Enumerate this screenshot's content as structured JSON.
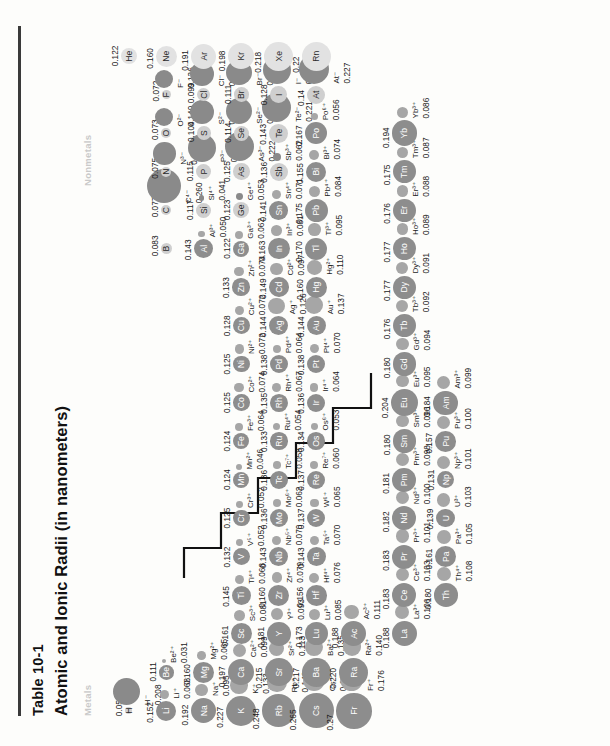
{
  "header": {
    "table_number": "Table 10-1",
    "title": "Atomic and Ionic Radii (in nanometers)",
    "legend_metals": "Metals",
    "legend_nonmetals": "Nonmetals"
  },
  "colors": {
    "metal_atom": "#8d8d8d",
    "nonmetal_atom": "#cfcfcf",
    "noble_atom": "#e2e2e2",
    "ion": "#a6a6a6",
    "rule": "#3a3a3a",
    "legend_text": "#c9c9c9"
  },
  "chart_data": {
    "type": "scatter",
    "title": "Atomic and Ionic Radii (in nanometers)",
    "xlabel": "Periodic group",
    "ylabel": "Period",
    "legend": [
      "Metals",
      "Nonmetals"
    ],
    "units": "nanometers",
    "note": "Circle area is proportional to radius; each element shows the neutral atom radius (large circle) and, where applicable, a common ion radius (small circle).",
    "elements": [
      {
        "symbol": "H",
        "atom": "0.053",
        "ion_symbol": "H⁻",
        "ion": "0.208",
        "class": "nonmetal",
        "group": 1,
        "period": 1
      },
      {
        "symbol": "He",
        "atom": "0.122",
        "ion_symbol": "",
        "ion": "",
        "class": "noble",
        "group": 18,
        "period": 1
      },
      {
        "symbol": "Li",
        "atom": "0.152",
        "ion_symbol": "Li⁺",
        "ion": "0.068",
        "class": "metal",
        "group": 1,
        "period": 2
      },
      {
        "symbol": "Be",
        "atom": "0.111",
        "ion_symbol": "Be²⁺",
        "ion": "0.031",
        "class": "metal",
        "group": 2,
        "period": 2
      },
      {
        "symbol": "B",
        "atom": "0.083",
        "ion_symbol": "",
        "ion": "",
        "class": "nonmetal",
        "group": 13,
        "period": 2
      },
      {
        "symbol": "C",
        "atom": "0.077",
        "ion_symbol": "C⁴⁻",
        "ion": "0.260",
        "class": "nonmetal",
        "group": 14,
        "period": 2
      },
      {
        "symbol": "N",
        "atom": "0.075",
        "ion_symbol": "N³⁻",
        "ion": "0.171",
        "class": "nonmetal",
        "group": 15,
        "period": 2
      },
      {
        "symbol": "O",
        "atom": "0.073",
        "ion_symbol": "O²⁻",
        "ion": "0.140",
        "class": "nonmetal",
        "group": 16,
        "period": 2
      },
      {
        "symbol": "F",
        "atom": "0.072",
        "ion_symbol": "F⁻",
        "ion": "0.136",
        "class": "nonmetal",
        "group": 17,
        "period": 2
      },
      {
        "symbol": "Ne",
        "atom": "0.160",
        "ion_symbol": "",
        "ion": "",
        "class": "noble",
        "group": 18,
        "period": 2
      },
      {
        "symbol": "Na",
        "atom": "0.192",
        "ion_symbol": "Na⁺",
        "ion": "0.095",
        "class": "metal",
        "group": 1,
        "period": 3
      },
      {
        "symbol": "Mg",
        "atom": "0.160",
        "ion_symbol": "Mg²⁺",
        "ion": "0.065",
        "class": "metal",
        "group": 2,
        "period": 3
      },
      {
        "symbol": "Al",
        "atom": "0.143",
        "ion_symbol": "Al³⁺",
        "ion": "0.050",
        "class": "metal",
        "group": 13,
        "period": 3
      },
      {
        "symbol": "Si",
        "atom": "0.117",
        "ion_symbol": "Si⁴⁺",
        "ion": "0.041",
        "class": "nonmetal",
        "group": 14,
        "period": 3
      },
      {
        "symbol": "P",
        "atom": "0.115",
        "ion_symbol": "P³⁻",
        "ion": "0.212",
        "class": "nonmetal",
        "group": 15,
        "period": 3
      },
      {
        "symbol": "S",
        "atom": "0.104",
        "ion_symbol": "S²⁻",
        "ion": "0.184",
        "class": "nonmetal",
        "group": 16,
        "period": 3
      },
      {
        "symbol": "Cl",
        "atom": "0.099",
        "ion_symbol": "Cl⁻",
        "ion": "0.181",
        "class": "nonmetal",
        "group": 17,
        "period": 3
      },
      {
        "symbol": "Ar",
        "atom": "0.191",
        "ion_symbol": "",
        "ion": "",
        "class": "noble",
        "group": 18,
        "period": 3
      },
      {
        "symbol": "K",
        "atom": "0.227",
        "ion_symbol": "K⁺",
        "ion": "0.133",
        "class": "metal",
        "group": 1,
        "period": 4
      },
      {
        "symbol": "Ca",
        "atom": "0.197",
        "ion_symbol": "Ca²⁺",
        "ion": "0.099",
        "class": "metal",
        "group": 2,
        "period": 4
      },
      {
        "symbol": "Sc",
        "atom": "0.161",
        "ion_symbol": "Sc³⁺",
        "ion": "0.081",
        "class": "metal",
        "group": 3,
        "period": 4
      },
      {
        "symbol": "Ti",
        "atom": "0.145",
        "ion_symbol": "Ti⁴⁺",
        "ion": "0.068",
        "class": "metal",
        "group": 4,
        "period": 4
      },
      {
        "symbol": "V",
        "atom": "0.132",
        "ion_symbol": "V⁵⁺",
        "ion": "0.052",
        "class": "metal",
        "group": 5,
        "period": 4
      },
      {
        "symbol": "Cr",
        "atom": "0.125",
        "ion_symbol": "Cr³⁺",
        "ion": "0.052",
        "class": "metal",
        "group": 6,
        "period": 4
      },
      {
        "symbol": "Mn",
        "atom": "0.124",
        "ion_symbol": "Mn²⁺",
        "ion": "0.046",
        "class": "metal",
        "group": 7,
        "period": 4
      },
      {
        "symbol": "Fe",
        "atom": "0.124",
        "ion_symbol": "Fe³⁺",
        "ion": "0.064",
        "class": "metal",
        "group": 8,
        "period": 4
      },
      {
        "symbol": "Co",
        "atom": "0.125",
        "ion_symbol": "Co²⁺",
        "ion": "0.074",
        "class": "metal",
        "group": 9,
        "period": 4
      },
      {
        "symbol": "Ni",
        "atom": "0.125",
        "ion_symbol": "Ni²⁺",
        "ion": "0.072",
        "class": "metal",
        "group": 10,
        "period": 4
      },
      {
        "symbol": "Cu",
        "atom": "0.128",
        "ion_symbol": "Cu²⁺",
        "ion": "0.072",
        "class": "metal",
        "group": 11,
        "period": 4
      },
      {
        "symbol": "Zn",
        "atom": "0.133",
        "ion_symbol": "Zn²⁺",
        "ion": "0.074",
        "class": "metal",
        "group": 12,
        "period": 4
      },
      {
        "symbol": "Ga",
        "atom": "0.122",
        "ion_symbol": "Ga³⁺",
        "ion": "0.062",
        "class": "metal",
        "group": 13,
        "period": 4
      },
      {
        "symbol": "Ge",
        "atom": "0.123",
        "ion_symbol": "Ge⁴⁺",
        "ion": "0.053",
        "class": "nonmetal",
        "group": 14,
        "period": 4
      },
      {
        "symbol": "As",
        "atom": "0.125",
        "ion_symbol": "As³⁻",
        "ion": "0.222",
        "class": "nonmetal",
        "group": 15,
        "period": 4
      },
      {
        "symbol": "Se",
        "atom": "0.114",
        "ion_symbol": "Se²⁻",
        "ion": "0.198",
        "class": "nonmetal",
        "group": 16,
        "period": 4
      },
      {
        "symbol": "Br",
        "atom": "0.111",
        "ion_symbol": "Br⁻",
        "ion": "0.196",
        "class": "nonmetal",
        "group": 17,
        "period": 4
      },
      {
        "symbol": "Kr",
        "atom": "0.198",
        "ion_symbol": "",
        "ion": "",
        "class": "noble",
        "group": 18,
        "period": 4
      },
      {
        "symbol": "Rb",
        "atom": "0.248",
        "ion_symbol": "Rb⁺",
        "ion": "0.148",
        "class": "metal",
        "group": 1,
        "period": 5
      },
      {
        "symbol": "Sr",
        "atom": "0.215",
        "ion_symbol": "Sr²⁺",
        "ion": "0.113",
        "class": "metal",
        "group": 2,
        "period": 5
      },
      {
        "symbol": "Y",
        "atom": "0.181",
        "ion_symbol": "Y³⁺",
        "ion": "0.093",
        "class": "metal",
        "group": 3,
        "period": 5
      },
      {
        "symbol": "Zr",
        "atom": "0.160",
        "ion_symbol": "Zr⁴⁺",
        "ion": "0.079",
        "class": "metal",
        "group": 4,
        "period": 5
      },
      {
        "symbol": "Nb",
        "atom": "0.143",
        "ion_symbol": "Nb⁵⁺",
        "ion": "0.070",
        "class": "metal",
        "group": 5,
        "period": 5
      },
      {
        "symbol": "Mo",
        "atom": "0.136",
        "ion_symbol": "Mo⁶⁺",
        "ion": "0.062",
        "class": "metal",
        "group": 6,
        "period": 5
      },
      {
        "symbol": "Tc",
        "atom": "0.136",
        "ion_symbol": "Tc⁷⁺",
        "ion": "0.058",
        "class": "metal",
        "group": 7,
        "period": 5
      },
      {
        "symbol": "Ru",
        "atom": "0.133",
        "ion_symbol": "Ru⁴⁺",
        "ion": "0.054",
        "class": "metal",
        "group": 8,
        "period": 5
      },
      {
        "symbol": "Rh",
        "atom": "0.135",
        "ion_symbol": "Rh⁴⁺",
        "ion": "0.067",
        "class": "metal",
        "group": 9,
        "period": 5
      },
      {
        "symbol": "Pd",
        "atom": "0.138",
        "ion_symbol": "Pd⁴⁺",
        "ion": "0.064",
        "class": "metal",
        "group": 10,
        "period": 5
      },
      {
        "symbol": "Ag",
        "atom": "0.144",
        "ion_symbol": "Ag⁺",
        "ion": "0.126",
        "class": "metal",
        "group": 11,
        "period": 5
      },
      {
        "symbol": "Cd",
        "atom": "0.149",
        "ion_symbol": "Cd²⁺",
        "ion": "0.097",
        "class": "metal",
        "group": 12,
        "period": 5
      },
      {
        "symbol": "In",
        "atom": "0.163",
        "ion_symbol": "In³⁺",
        "ion": "0.081",
        "class": "metal",
        "group": 13,
        "period": 5
      },
      {
        "symbol": "Sn",
        "atom": "0.141",
        "ion_symbol": "Sn⁴⁺",
        "ion": "0.071",
        "class": "metal",
        "group": 14,
        "period": 5
      },
      {
        "symbol": "Sb",
        "atom": "0.136",
        "ion_symbol": "Sb³⁺",
        "ion": "0.062",
        "class": "nonmetal",
        "group": 15,
        "period": 5
      },
      {
        "symbol": "Te",
        "atom": "0.143",
        "ion_symbol": "Te²⁻",
        "ion": "0.221",
        "class": "nonmetal",
        "group": 16,
        "period": 5
      },
      {
        "symbol": "I",
        "atom": "0.128",
        "ion_symbol": "I⁻",
        "ion": "0.216",
        "class": "nonmetal",
        "group": 17,
        "period": 5
      },
      {
        "symbol": "Xe",
        "atom": "0.218",
        "ion_symbol": "",
        "ion": "",
        "class": "noble",
        "group": 18,
        "period": 5
      },
      {
        "symbol": "Cs",
        "atom": "0.265",
        "ion_symbol": "Cs⁺",
        "ion": "0.169",
        "class": "metal",
        "group": 1,
        "period": 6
      },
      {
        "symbol": "Ba",
        "atom": "0.217",
        "ion_symbol": "Ba²⁺",
        "ion": "0.135",
        "class": "metal",
        "group": 2,
        "period": 6
      },
      {
        "symbol": "Lu",
        "atom": "0.173",
        "ion_symbol": "Lu³⁺",
        "ion": "0.085",
        "class": "metal",
        "group": 3,
        "period": 6
      },
      {
        "symbol": "Hf",
        "atom": "0.156",
        "ion_symbol": "Hf⁴⁺",
        "ion": "0.076",
        "class": "metal",
        "group": 4,
        "period": 6
      },
      {
        "symbol": "Ta",
        "atom": "0.143",
        "ion_symbol": "Ta⁵⁺",
        "ion": "0.070",
        "class": "metal",
        "group": 5,
        "period": 6
      },
      {
        "symbol": "W",
        "atom": "0.137",
        "ion_symbol": "W⁶⁺",
        "ion": "0.065",
        "class": "metal",
        "group": 6,
        "period": 6
      },
      {
        "symbol": "Re",
        "atom": "0.137",
        "ion_symbol": "Re⁷⁺",
        "ion": "0.060",
        "class": "metal",
        "group": 7,
        "period": 6
      },
      {
        "symbol": "Os",
        "atom": "0.134",
        "ion_symbol": "Os⁶⁺",
        "ion": "0.053",
        "class": "metal",
        "group": 8,
        "period": 6
      },
      {
        "symbol": "Ir",
        "atom": "0.136",
        "ion_symbol": "Ir⁴⁺",
        "ion": "0.064",
        "class": "metal",
        "group": 9,
        "period": 6
      },
      {
        "symbol": "Pt",
        "atom": "0.138",
        "ion_symbol": "Pt⁴⁺",
        "ion": "0.070",
        "class": "metal",
        "group": 10,
        "period": 6
      },
      {
        "symbol": "Au",
        "atom": "0.144",
        "ion_symbol": "Au⁺",
        "ion": "0.137",
        "class": "metal",
        "group": 11,
        "period": 6
      },
      {
        "symbol": "Hg",
        "atom": "0.160",
        "ion_symbol": "Hg²⁺",
        "ion": "0.110",
        "class": "metal",
        "group": 12,
        "period": 6
      },
      {
        "symbol": "Tl",
        "atom": "0.170",
        "ion_symbol": "Tl³⁺",
        "ion": "0.095",
        "class": "metal",
        "group": 13,
        "period": 6
      },
      {
        "symbol": "Pb",
        "atom": "0.175",
        "ion_symbol": "Pb⁴⁺",
        "ion": "0.084",
        "class": "metal",
        "group": 14,
        "period": 6
      },
      {
        "symbol": "Bi",
        "atom": "0.155",
        "ion_symbol": "Bi³⁺",
        "ion": "0.074",
        "class": "metal",
        "group": 15,
        "period": 6
      },
      {
        "symbol": "Po",
        "atom": "0.167",
        "ion_symbol": "Po⁶⁺",
        "ion": "0.056",
        "class": "metal",
        "group": 16,
        "period": 6
      },
      {
        "symbol": "At",
        "atom": "0.14",
        "ion_symbol": "At⁻",
        "ion": "0.227",
        "class": "nonmetal",
        "group": 17,
        "period": 6
      },
      {
        "symbol": "Rn",
        "atom": "0.22",
        "ion_symbol": "",
        "ion": "",
        "class": "noble",
        "group": 18,
        "period": 6
      },
      {
        "symbol": "Fr",
        "atom": "0.27",
        "ion_symbol": "Fr⁺",
        "ion": "0.176",
        "class": "metal",
        "group": 1,
        "period": 7
      },
      {
        "symbol": "Ra",
        "atom": "0.220",
        "ion_symbol": "Ra²⁺",
        "ion": "0.140",
        "class": "metal",
        "group": 2,
        "period": 7
      },
      {
        "symbol": "Ac",
        "atom": "0.188",
        "ion_symbol": "Ac³⁺",
        "ion": "0.111",
        "class": "metal",
        "group": 3,
        "period": 7
      }
    ],
    "lanthanides": [
      {
        "symbol": "La",
        "atom": "0.188",
        "ion_symbol": "La³⁺",
        "ion": "0.106",
        "class": "metal"
      },
      {
        "symbol": "Ce",
        "atom": "0.183",
        "ion_symbol": "Ce³⁺",
        "ion": "0.103",
        "class": "metal"
      },
      {
        "symbol": "Pr",
        "atom": "0.183",
        "ion_symbol": "Pr³⁺",
        "ion": "0.101",
        "class": "metal"
      },
      {
        "symbol": "Nd",
        "atom": "0.182",
        "ion_symbol": "Nd³⁺",
        "ion": "0.100",
        "class": "metal"
      },
      {
        "symbol": "Pm",
        "atom": "0.181",
        "ion_symbol": "Pm³⁺",
        "ion": "0.098",
        "class": "metal"
      },
      {
        "symbol": "Sm",
        "atom": "0.180",
        "ion_symbol": "Sm³⁺",
        "ion": "0.096",
        "class": "metal"
      },
      {
        "symbol": "Eu",
        "atom": "0.204",
        "ion_symbol": "Eu³⁺",
        "ion": "0.095",
        "class": "metal"
      },
      {
        "symbol": "Gd",
        "atom": "0.180",
        "ion_symbol": "Gd³⁺",
        "ion": "0.094",
        "class": "metal"
      },
      {
        "symbol": "Tb",
        "atom": "0.176",
        "ion_symbol": "Tb³⁺",
        "ion": "0.092",
        "class": "metal"
      },
      {
        "symbol": "Dy",
        "atom": "0.177",
        "ion_symbol": "Dy³⁺",
        "ion": "0.091",
        "class": "metal"
      },
      {
        "symbol": "Ho",
        "atom": "0.177",
        "ion_symbol": "Ho³⁺",
        "ion": "0.089",
        "class": "metal"
      },
      {
        "symbol": "Er",
        "atom": "0.176",
        "ion_symbol": "Er³⁺",
        "ion": "0.088",
        "class": "metal"
      },
      {
        "symbol": "Tm",
        "atom": "0.175",
        "ion_symbol": "Tm³⁺",
        "ion": "0.087",
        "class": "metal"
      },
      {
        "symbol": "Yb",
        "atom": "0.194",
        "ion_symbol": "Yb³⁺",
        "ion": "0.086",
        "class": "metal"
      }
    ],
    "actinides": [
      {
        "symbol": "Th",
        "atom": "0.180",
        "ion_symbol": "Th⁴⁺",
        "ion": "0.108",
        "class": "metal"
      },
      {
        "symbol": "Pa",
        "atom": "0.161",
        "ion_symbol": "Pa³⁺",
        "ion": "0.105",
        "class": "metal"
      },
      {
        "symbol": "U",
        "atom": "0.139",
        "ion_symbol": "U³⁺",
        "ion": "0.103",
        "class": "metal"
      },
      {
        "symbol": "Np",
        "atom": "0.131",
        "ion_symbol": "Np³⁺",
        "ion": "0.101",
        "class": "metal"
      },
      {
        "symbol": "Pu",
        "atom": "0.157",
        "ion_symbol": "Pu³⁺",
        "ion": "0.100",
        "class": "metal"
      },
      {
        "symbol": "Am",
        "atom": "0.184",
        "ion_symbol": "Am³⁺",
        "ion": "0.099",
        "class": "metal"
      }
    ]
  }
}
